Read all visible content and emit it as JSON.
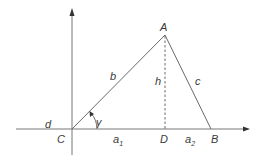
{
  "diagram": {
    "type": "triangle-with-altitude",
    "colors": {
      "lines": "#6a6a6a",
      "labels": "#3a3a3a",
      "background": "#ffffff"
    },
    "vertices": {
      "A": {
        "label": "A",
        "x": 165,
        "y": 35
      },
      "B": {
        "label": "B",
        "x": 211,
        "y": 129
      },
      "C": {
        "label": "C",
        "x": 72,
        "y": 129
      },
      "D": {
        "label": "D",
        "x": 165,
        "y": 129
      }
    },
    "sides": {
      "b": {
        "label": "b",
        "from": "C",
        "to": "A"
      },
      "c": {
        "label": "c",
        "from": "A",
        "to": "B"
      },
      "h": {
        "label": "h",
        "from": "A",
        "to": "D",
        "style": "dashed"
      },
      "a1": {
        "label": "a",
        "subscript": "1",
        "from": "C",
        "to": "D"
      },
      "a2": {
        "label": "a",
        "subscript": "2",
        "from": "D",
        "to": "B"
      }
    },
    "angle": {
      "label": "γ",
      "at": "C"
    },
    "extra_labels": {
      "d": "d"
    },
    "axes": {
      "x": {
        "from": [
          16,
          129
        ],
        "to": [
          250,
          129
        ],
        "arrow": true
      },
      "y": {
        "from": [
          72,
          155
        ],
        "to": [
          72,
          8
        ],
        "arrow": true
      }
    }
  }
}
